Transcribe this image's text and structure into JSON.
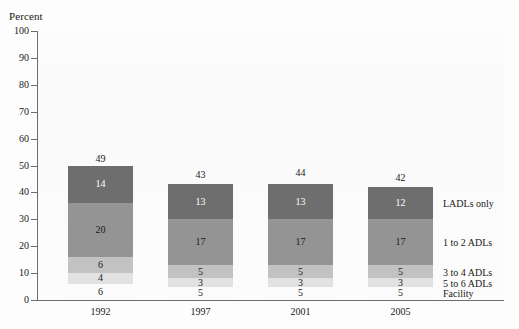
{
  "chart_data": {
    "type": "bar",
    "subtype": "stacked",
    "title": "",
    "ylabel": "Percent",
    "xlabel": "",
    "ylim": [
      0,
      100
    ],
    "yticks": [
      0,
      10,
      20,
      30,
      40,
      50,
      60,
      70,
      80,
      90,
      100
    ],
    "grid": false,
    "legend_position": "right-inline",
    "categories": [
      "1992",
      "1997",
      "2001",
      "2005"
    ],
    "totals": [
      49,
      43,
      44,
      42
    ],
    "series": [
      {
        "name": "LADLs only",
        "color": "#6e6e6e",
        "text_color": "#ffffff",
        "values": [
          14,
          13,
          13,
          12
        ]
      },
      {
        "name": "1 to 2 ADLs",
        "color": "#949494",
        "text_color": "#1a1a1a",
        "values": [
          20,
          17,
          17,
          17
        ]
      },
      {
        "name": "3 to 4 ADLs",
        "color": "#c2c2c2",
        "text_color": "#1a1a1a",
        "values": [
          6,
          5,
          5,
          5
        ]
      },
      {
        "name": "5 to 6 ADLs",
        "color": "#e2e2e2",
        "text_color": "#1a1a1a",
        "values": [
          4,
          3,
          3,
          3
        ]
      },
      {
        "name": "Facility",
        "color": "#fbfbfb",
        "text_color": "#1a1a1a",
        "values": [
          6,
          5,
          5,
          5
        ]
      }
    ]
  },
  "axis": {
    "y_title": "Percent",
    "tick_labels": [
      "100",
      "90",
      "80",
      "70",
      "60",
      "50",
      "40",
      "30",
      "20",
      "10",
      "0"
    ]
  },
  "legend": {
    "items": [
      {
        "label": "LADLs only"
      },
      {
        "label": "1 to 2 ADLs"
      },
      {
        "label": "3 to 4 ADLs"
      },
      {
        "label": "5 to 6 ADLs"
      },
      {
        "label": "Facility"
      }
    ]
  },
  "x_labels": [
    "1992",
    "1997",
    "2001",
    "2005"
  ],
  "bar_totals_text": [
    "49",
    "43",
    "44",
    "42"
  ],
  "segment_text": {
    "ladls_only": [
      "14",
      "13",
      "13",
      "12"
    ],
    "adls_1_2": [
      "20",
      "17",
      "17",
      "17"
    ],
    "adls_3_4": [
      "6",
      "5",
      "5",
      "5"
    ],
    "adls_5_6": [
      "4",
      "3",
      "3",
      "3"
    ],
    "facility": [
      "6",
      "5",
      "5",
      "5"
    ]
  },
  "colors": {
    "ladls_only": "#6e6e6e",
    "adls_1_2": "#949494",
    "adls_3_4": "#c2c2c2",
    "adls_5_6": "#e2e2e2",
    "facility": "#fbfbfb",
    "axis": "#6d6d6d",
    "text": "#1a1a1a",
    "plot_bg": "#fafafa"
  }
}
